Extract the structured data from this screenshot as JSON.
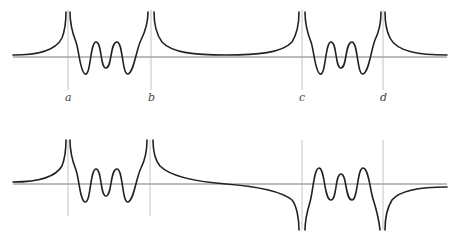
{
  "diagram": {
    "top_plot": {
      "labels": [
        "a",
        "b",
        "c",
        "d"
      ],
      "pole_behavior": "all poles go to +infinity on both sides"
    },
    "bottom_plot": {
      "labels": [],
      "pole_behavior": "poles at a,b go to +infinity; poles at c,d go to -infinity"
    },
    "colors": {
      "curve": "#222222",
      "axis": "#555555",
      "guide": "#aaaaaa"
    }
  },
  "labels": {
    "a": "a",
    "b": "b",
    "c": "c",
    "d": "d"
  }
}
